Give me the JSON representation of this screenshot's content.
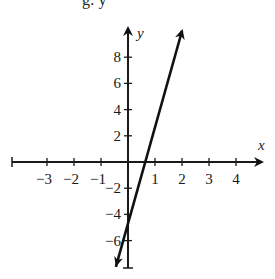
{
  "top_fragment": "g: y",
  "chart_data": {
    "type": "line",
    "title": "",
    "xlabel": "x",
    "ylabel": "y",
    "xlim": [
      -4,
      4.6
    ],
    "ylim": [
      -8,
      10.5
    ],
    "grid": false,
    "x_ticks": [
      -3,
      -2,
      -1,
      1,
      2,
      3,
      4
    ],
    "x_tick_labels": [
      "−3",
      "−2",
      "−1",
      "1",
      "2",
      "3",
      "4"
    ],
    "y_ticks": [
      -6,
      -4,
      -2,
      2,
      4,
      6,
      8
    ],
    "y_tick_labels": [
      "−6",
      "−4",
      "−2",
      "2",
      "4",
      "6",
      "8"
    ],
    "series": [
      {
        "name": "line",
        "equation": "y = 8x - 6",
        "slope": 8,
        "intercept": -6,
        "x": [
          -0.45,
          2.0
        ],
        "y": [
          -8.0,
          10.0
        ],
        "x_intercept": 0.75,
        "arrows": "both",
        "color": "#111111"
      }
    ]
  },
  "colors": {
    "axis": "#1a1a1a",
    "line": "#111111",
    "background": "#ffffff"
  }
}
